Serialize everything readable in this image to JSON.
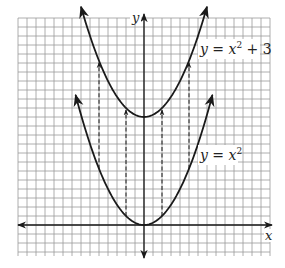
{
  "chart_data": {
    "type": "line",
    "title": "",
    "xlabel": "x",
    "ylabel": "y",
    "grid": true,
    "series": [
      {
        "name": "y = x^2",
        "label": "y = x²",
        "label_main": "y = x",
        "label_sup": "2",
        "label_tail": "",
        "formula": "x^2",
        "shift": 0,
        "x_range": [
          -1.9,
          1.9
        ]
      },
      {
        "name": "y = x^2 + 3",
        "label": "y = x² + 3",
        "label_main": "y = x",
        "label_sup": "2",
        "label_tail": " + 3",
        "formula": "x^2 + 3",
        "shift": 3,
        "x_range": [
          -1.75,
          1.75
        ]
      }
    ],
    "vertical_shift_arrows": [
      {
        "x": -1.25,
        "from": 1.5625,
        "to": 4.5625
      },
      {
        "x": -0.5,
        "from": 0.25,
        "to": 3.25
      },
      {
        "x": 0.5,
        "from": 0.25,
        "to": 3.25
      },
      {
        "x": 1.25,
        "from": 1.5625,
        "to": 4.5625
      }
    ],
    "xlim": [
      -3.5,
      3.5
    ],
    "ylim": [
      -0.8,
      5.8
    ],
    "annotations": [
      "y = x² + 3",
      "y = x²"
    ]
  },
  "axes": {
    "x_label": "x",
    "y_label": "y"
  },
  "colors": {
    "grid": "#9a9a9a",
    "curve": "#1a1a1a",
    "background": "#ffffff"
  }
}
